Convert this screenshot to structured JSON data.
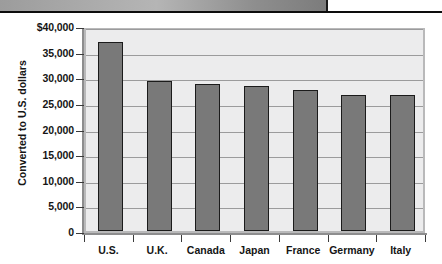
{
  "figure": {
    "scan_band": "scanned-page-edge"
  },
  "chart_data": {
    "type": "bar",
    "title": "",
    "xlabel": "",
    "ylabel": "Converted to U.S. dollars",
    "categories": [
      "U.S.",
      "U.K.",
      "Canada",
      "Japan",
      "France",
      "Germany",
      "Italy"
    ],
    "values": [
      36900,
      29200,
      28600,
      28200,
      27600,
      26500,
      26600
    ],
    "ylim": [
      0,
      40000
    ],
    "ytick_values": [
      0,
      5000,
      10000,
      15000,
      20000,
      25000,
      30000,
      35000,
      40000
    ],
    "ytick_labels": [
      "0",
      "5,000",
      "10,000",
      "15,000",
      "20,000",
      "25,000",
      "30,000",
      "35,000",
      "$40,000"
    ],
    "grid": true,
    "legend": null,
    "bar_color": "#797979",
    "bar_border_color": "#1b1b1b",
    "plot_background": "#ececed",
    "gridline_color": "#9b9b9c",
    "axis_color": "#8d8d8e",
    "text_color": "#151515"
  }
}
